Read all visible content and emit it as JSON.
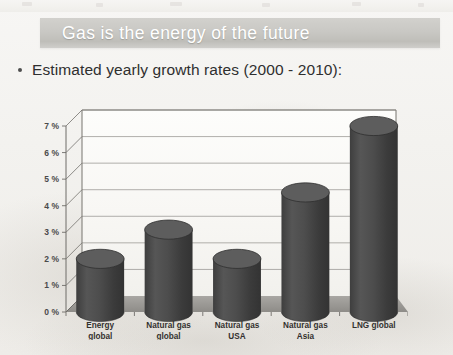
{
  "slide": {
    "title": "Gas is the energy of the future",
    "bullet": "Estimated yearly growth rates (2000 - 2010):",
    "bullet_marker": "bullet-dot",
    "banner_color": "#c9c8c4",
    "title_color": "#ffffff",
    "background_color": "#f2f1ee"
  },
  "chart_data": {
    "type": "bar",
    "title": "",
    "subtitle": "",
    "xlabel": "",
    "ylabel": "",
    "categories": [
      "Energy global",
      "Natural gas global",
      "Natural gas USA",
      "Natural gas Asia",
      "LNG global"
    ],
    "category_lines": [
      [
        "Energy",
        "global"
      ],
      [
        "Natural gas",
        "global"
      ],
      [
        "Natural gas",
        "USA"
      ],
      [
        "Natural gas",
        "Asia"
      ],
      [
        "LNG global",
        ""
      ]
    ],
    "values": [
      2.0,
      3.1,
      2.0,
      4.5,
      7.0
    ],
    "value_unit": "%",
    "ylim": [
      0,
      7
    ],
    "yticks": [
      0,
      1,
      2,
      3,
      4,
      5,
      6,
      7
    ],
    "ytick_labels": [
      "0 %",
      "1 %",
      "2 %",
      "3 %",
      "4 %",
      "5 %",
      "6 %",
      "7 %"
    ],
    "grid": true,
    "legend": "none",
    "style": "3d-cylinder",
    "bar_color": "#4a4a4a",
    "bar_top_color": "#5d5d5d",
    "floor_color": "#9c9a96",
    "axis_color": "#6f6d69",
    "gridline_color": "#8d8b87",
    "plot_background": "#fbfaf8"
  }
}
